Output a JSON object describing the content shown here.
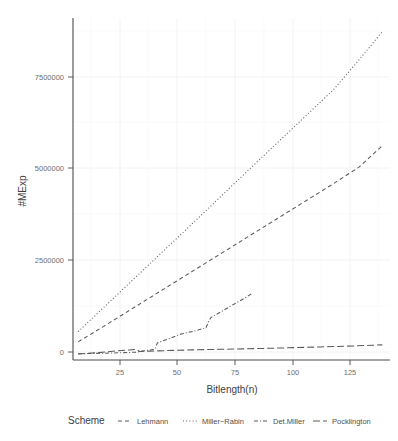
{
  "chart_data": {
    "type": "line",
    "title": "",
    "subtitle": "",
    "xlabel": "Bitlength(n)",
    "ylabel": "#MExp",
    "xlim": [
      8,
      132
    ],
    "ylim": [
      -150000,
      8900000
    ],
    "xticks": [
      25,
      50,
      75,
      100,
      125
    ],
    "xticklabels": [
      "25",
      "50",
      "75",
      "100",
      "125"
    ],
    "yticks": [
      0,
      2500000,
      5000000,
      7500000
    ],
    "yticklabels": [
      "0",
      "2500000",
      "5000000",
      "7500000"
    ],
    "grid": true,
    "legend_position": "bottom",
    "legend_title": "Scheme",
    "series": [
      {
        "name": "Lehmann",
        "linestyle": "dashed",
        "x": [
          10,
          20,
          30,
          40,
          50,
          60,
          70,
          80,
          90,
          100,
          110,
          120,
          129
        ],
        "y": [
          330000,
          740000,
          1160000,
          1580000,
          2000000,
          2420000,
          2840000,
          3260000,
          3680000,
          4100000,
          4520000,
          4960000,
          5520000
        ]
      },
      {
        "name": "Miller-Rabin",
        "linestyle": "dotted",
        "x": [
          10,
          20,
          30,
          40,
          50,
          60,
          70,
          80,
          90,
          100,
          110,
          120,
          129
        ],
        "y": [
          600000,
          1240000,
          1880000,
          2520000,
          3160000,
          3800000,
          4450000,
          5090000,
          5730000,
          6370000,
          7010000,
          7800000,
          8540000
        ]
      },
      {
        "name": "Det.Miller",
        "linestyle": "dashdot",
        "x": [
          10,
          20,
          28,
          32,
          33,
          36,
          40,
          41,
          45,
          50,
          55,
          60,
          61,
          62,
          66,
          70,
          75,
          78
        ],
        "y": [
          15000,
          30000,
          45000,
          55000,
          58000,
          95000,
          130000,
          300000,
          400000,
          530000,
          610000,
          700000,
          860000,
          980000,
          1130000,
          1290000,
          1480000,
          1610000
        ]
      },
      {
        "name": "Pocklington",
        "linestyle": "longdash",
        "x": [
          10,
          18,
          25,
          30,
          33,
          34,
          38,
          45,
          55,
          65,
          75,
          85,
          95,
          105,
          115,
          125,
          129
        ],
        "y": [
          10000,
          45000,
          90000,
          115000,
          130000,
          75000,
          85000,
          100000,
          118000,
          132000,
          145000,
          160000,
          178000,
          196000,
          216000,
          240000,
          250000
        ]
      }
    ]
  },
  "axes": {
    "x_title": "Bitlength(n)",
    "y_title": "#MExp",
    "x_tick_labels": [
      "25",
      "50",
      "75",
      "100",
      "125"
    ],
    "y_tick_labels": [
      "7500000",
      "5000000",
      "2500000",
      "0"
    ]
  },
  "legend": {
    "title": "Scheme",
    "items": [
      {
        "label": "Lehmann",
        "key": "dashed-line-key"
      },
      {
        "label": "Miller−Rabin",
        "key": "dotted-line-key"
      },
      {
        "label": "Det.Miller",
        "key": "dashdot-line-key"
      },
      {
        "label": "Pocklington",
        "key": "longdash-line-key"
      }
    ]
  },
  "colors": {
    "line": "#5a5a5a",
    "grid": "#efefef",
    "axis": "#4b4b4b",
    "text": "#3d3d3d",
    "tick_text": "#6e6e6e",
    "background": "#ffffff"
  }
}
